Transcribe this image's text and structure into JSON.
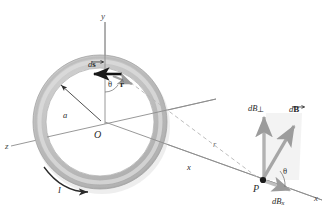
{
  "figure": {
    "colors": {
      "ring_outer": "#b9b9b9",
      "ring_inner": "#d8d8d8",
      "ring_stroke": "#9a9a9a",
      "axis_line": "#8c8c8c",
      "dashed_line": "#b0b0b0",
      "arrow_black": "#1a1a1a",
      "arrow_gray": "#a8a8a8",
      "shadow": "#d9d9d9",
      "text": "#2a2a2a",
      "background": "#ffffff"
    }
  },
  "axes": {
    "y_label": "y",
    "z_label": "z",
    "x_label": "x",
    "origin_label": "O"
  },
  "loop": {
    "radius_label": "a",
    "current_label": "I",
    "ds_label": "d",
    "ds_vector_symbol": "s",
    "rhat_label": "r",
    "angle_label": "θ"
  },
  "point": {
    "label": "P",
    "distance_on_axis_label": "x",
    "distance_to_element_label": "r",
    "angle_label": "θ"
  },
  "field_vectors": {
    "dB_label": "d",
    "dB_symbol": "B",
    "dB_perp_label": "dB",
    "dB_perp_subscript": "⊥",
    "dB_x_label": "dB",
    "dB_x_subscript": "x"
  }
}
